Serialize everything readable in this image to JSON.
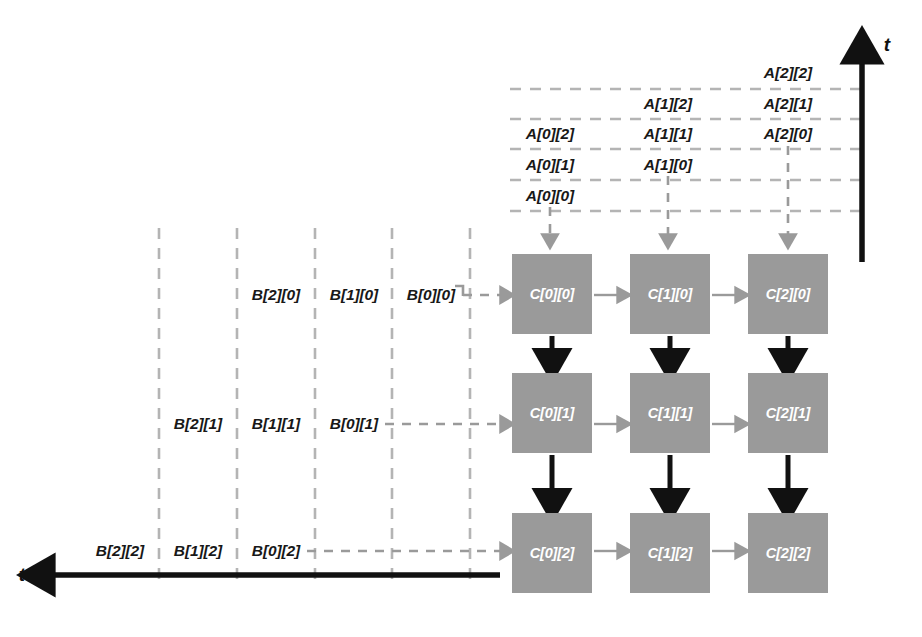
{
  "diagram": {
    "colors": {
      "pe_fill": "#9a9a9a",
      "pe_text": "#ffffff",
      "dashed_line": "#b0b0b0",
      "gray_arrow": "#9a9a9a",
      "black_arrow": "#111111",
      "label_text": "#181818",
      "background": "#ffffff"
    }
  },
  "axes": {
    "vertical": {
      "label": "t",
      "direction": "up",
      "name": "time-axis-vertical"
    },
    "horizontal": {
      "label": "t",
      "direction": "left",
      "name": "time-axis-horizontal"
    }
  },
  "a_operands": {
    "description": "A matrix elements streaming downward into the PE columns",
    "columns": [
      {
        "column_index": 0,
        "x": 550,
        "items": [
          {
            "label": "A[0][2]",
            "y": 134
          },
          {
            "label": "A[0][1]",
            "y": 165
          },
          {
            "label": "A[0][0]",
            "y": 196
          }
        ]
      },
      {
        "column_index": 1,
        "x": 668,
        "items": [
          {
            "label": "A[1][2]",
            "y": 104
          },
          {
            "label": "A[1][1]",
            "y": 134
          },
          {
            "label": "A[1][0]",
            "y": 165
          }
        ]
      },
      {
        "column_index": 2,
        "x": 788,
        "items": [
          {
            "label": "A[2][2]",
            "y": 73
          },
          {
            "label": "A[2][1]",
            "y": 104
          },
          {
            "label": "A[2][0]",
            "y": 134
          }
        ]
      }
    ]
  },
  "b_operands": {
    "description": "B matrix elements streaming rightward into the PE rows",
    "rows": [
      {
        "row_index": 0,
        "y": 295,
        "items": [
          {
            "label": "B[2][0]",
            "x": 276
          },
          {
            "label": "B[1][0]",
            "x": 354
          },
          {
            "label": "B[0][0]",
            "x": 431
          }
        ]
      },
      {
        "row_index": 1,
        "y": 424,
        "items": [
          {
            "label": "B[2][1]",
            "x": 198
          },
          {
            "label": "B[1][1]",
            "x": 276
          },
          {
            "label": "B[0][1]",
            "x": 354
          }
        ]
      },
      {
        "row_index": 2,
        "y": 551,
        "items": [
          {
            "label": "B[2][2]",
            "x": 120
          },
          {
            "label": "B[1][2]",
            "x": 198
          },
          {
            "label": "B[0][2]",
            "x": 276
          }
        ]
      }
    ]
  },
  "pe_grid": {
    "description": "3x3 grid of processing elements accumulating C = A x B",
    "block_width": 80,
    "block_height": 80,
    "column_x": [
      512,
      630,
      748
    ],
    "row_y": [
      254,
      373,
      513
    ],
    "cells": [
      [
        "C[0][0]",
        "C[1][0]",
        "C[2][0]"
      ],
      [
        "C[0][1]",
        "C[1][1]",
        "C[2][1]"
      ],
      [
        "C[0][2]",
        "C[1][2]",
        "C[2][2]"
      ]
    ]
  },
  "grid_lines": {
    "horizontal_dashed_y": [
      89,
      119,
      149,
      180,
      211
    ],
    "horizontal_dashed_x_start": 510,
    "horizontal_dashed_x_end": 862,
    "vertical_dashed_x": [
      159,
      237,
      315,
      392,
      470
    ],
    "vertical_dashed_y_start": 228,
    "vertical_dashed_y_end": 586
  }
}
